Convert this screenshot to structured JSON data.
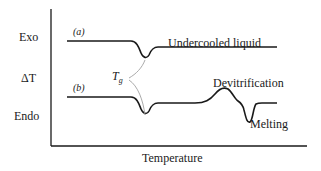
{
  "diagram": {
    "type": "DTA/DSC thermogram schematic",
    "y_axis": {
      "top_label": "Exo",
      "middle_label": "ΔT",
      "bottom_label": "Endo"
    },
    "x_axis": {
      "label": "Temperature"
    },
    "curves": [
      {
        "tag": "(a)",
        "annotation": "Undercooled liquid"
      },
      {
        "tag": "(b)",
        "annotations": [
          "Devitrification",
          "Melting"
        ]
      }
    ],
    "tg_label": {
      "main": "T",
      "sub": "g"
    },
    "colors": {
      "line": "#1a1a1a",
      "leader": "#a0a0a0",
      "background": "#ffffff"
    }
  }
}
